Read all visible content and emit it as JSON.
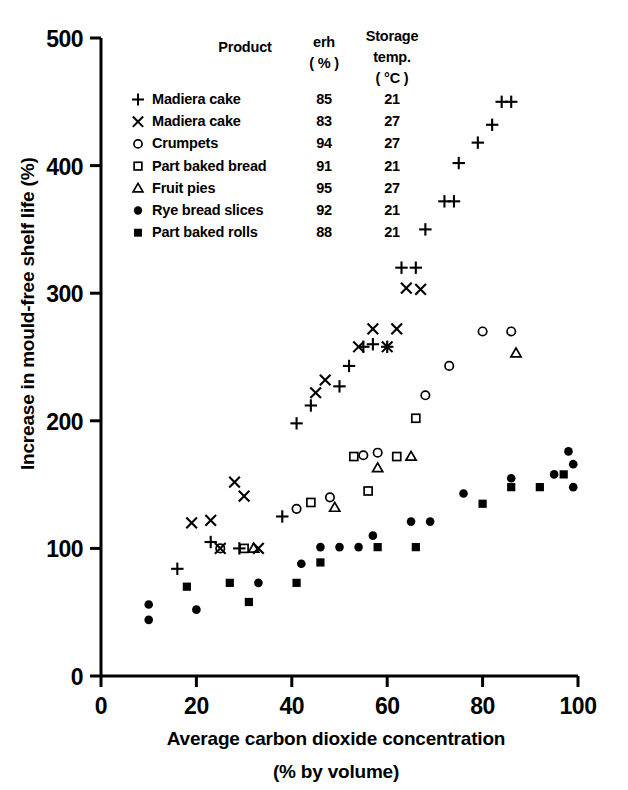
{
  "chart_data": {
    "type": "scatter",
    "title": "",
    "xlabel": "Average carbon dioxide concentration (% by volume)",
    "xlabel_line1": "Average carbon dioxide concentration",
    "xlabel_line2": "(% by volume)",
    "ylabel": "Increase in mould-free shelf life (%)",
    "xlim": [
      0,
      100
    ],
    "ylim": [
      0,
      500
    ],
    "xticks": [
      0,
      20,
      40,
      60,
      80,
      100
    ],
    "yticks": [
      0,
      100,
      200,
      300,
      400,
      500
    ],
    "xtick_labels": [
      "0",
      "20",
      "40",
      "60",
      "80",
      "100"
    ],
    "ytick_labels": [
      "0",
      "100",
      "200",
      "300",
      "400",
      "500"
    ],
    "grid": false,
    "legend_position": "upper-left-inside",
    "legend_headers": {
      "product": "Product",
      "erh": "erh",
      "erh_unit": "( % )",
      "temp_line1": "Storage",
      "temp_line2": "temp.",
      "temp_unit": "( °C )"
    },
    "series": [
      {
        "name": "Madiera cake",
        "marker": "plus",
        "erh": "85",
        "storage_temp": "21",
        "points": [
          [
            16,
            84
          ],
          [
            23,
            105
          ],
          [
            29,
            100
          ],
          [
            38,
            125
          ],
          [
            41,
            198
          ],
          [
            44,
            212
          ],
          [
            50,
            227
          ],
          [
            52,
            243
          ],
          [
            55,
            258
          ],
          [
            57,
            260
          ],
          [
            60,
            258
          ],
          [
            63,
            320
          ],
          [
            66,
            320
          ],
          [
            68,
            350
          ],
          [
            72,
            372
          ],
          [
            74,
            372
          ],
          [
            75,
            402
          ],
          [
            79,
            418
          ],
          [
            82,
            432
          ],
          [
            84,
            450
          ],
          [
            86,
            450
          ]
        ]
      },
      {
        "name": "Madiera cake",
        "marker": "cross",
        "erh": "83",
        "storage_temp": "27",
        "points": [
          [
            19,
            120
          ],
          [
            23,
            122
          ],
          [
            25,
            100
          ],
          [
            28,
            152
          ],
          [
            30,
            141
          ],
          [
            33,
            100
          ],
          [
            45,
            222
          ],
          [
            47,
            232
          ],
          [
            54,
            258
          ],
          [
            57,
            272
          ],
          [
            60,
            258
          ],
          [
            62,
            272
          ],
          [
            64,
            304
          ],
          [
            67,
            303
          ]
        ]
      },
      {
        "name": "Crumpets",
        "marker": "circle-open",
        "erh": "94",
        "storage_temp": "27",
        "points": [
          [
            25,
            100
          ],
          [
            41,
            131
          ],
          [
            48,
            140
          ],
          [
            55,
            173
          ],
          [
            58,
            175
          ],
          [
            68,
            220
          ],
          [
            73,
            243
          ],
          [
            80,
            270
          ],
          [
            86,
            270
          ]
        ]
      },
      {
        "name": "Part baked bread",
        "marker": "square-open",
        "erh": "91",
        "storage_temp": "21",
        "points": [
          [
            30,
            100
          ],
          [
            44,
            136
          ],
          [
            53,
            172
          ],
          [
            56,
            145
          ],
          [
            62,
            172
          ],
          [
            66,
            202
          ]
        ]
      },
      {
        "name": "Fruit pies",
        "marker": "triangle-open",
        "erh": "95",
        "storage_temp": "27",
        "points": [
          [
            32,
            100
          ],
          [
            49,
            132
          ],
          [
            58,
            163
          ],
          [
            65,
            172
          ],
          [
            87,
            253
          ]
        ]
      },
      {
        "name": "Rye bread slices",
        "marker": "circle-filled",
        "erh": "92",
        "storage_temp": "21",
        "points": [
          [
            10,
            56
          ],
          [
            10,
            44
          ],
          [
            20,
            52
          ],
          [
            33,
            73
          ],
          [
            42,
            88
          ],
          [
            46,
            101
          ],
          [
            50,
            101
          ],
          [
            54,
            101
          ],
          [
            57,
            110
          ],
          [
            65,
            121
          ],
          [
            69,
            121
          ],
          [
            76,
            143
          ],
          [
            86,
            155
          ],
          [
            95,
            158
          ],
          [
            98,
            176
          ],
          [
            99,
            166
          ],
          [
            99,
            148
          ]
        ]
      },
      {
        "name": "Part baked rolls",
        "marker": "square-filled",
        "erh": "88",
        "storage_temp": "21",
        "points": [
          [
            18,
            70
          ],
          [
            27,
            73
          ],
          [
            31,
            58
          ],
          [
            41,
            73
          ],
          [
            46,
            89
          ],
          [
            58,
            101
          ],
          [
            66,
            101
          ],
          [
            80,
            135
          ],
          [
            86,
            148
          ],
          [
            92,
            148
          ],
          [
            97,
            158
          ]
        ]
      }
    ]
  }
}
